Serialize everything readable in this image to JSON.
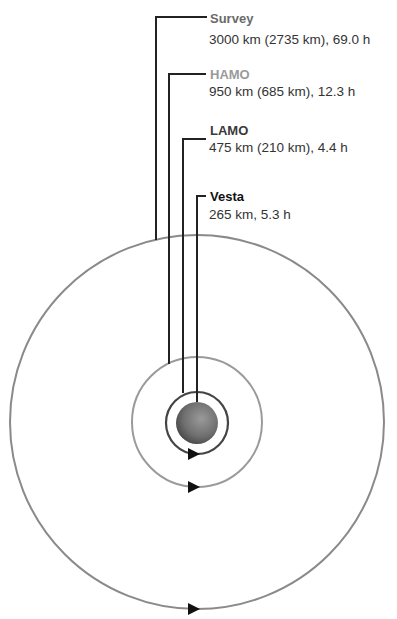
{
  "diagram": {
    "orbits": [
      {
        "name": "Survey",
        "detail": "3000 km (2735 km), 69.0 h",
        "label_color": "#6a6a6a",
        "ring_color": "#8a8a8a"
      },
      {
        "name": "HAMO",
        "detail": "950 km (685 km), 12.3 h",
        "label_color": "#9a9a9a",
        "ring_color": "#9a9a9a"
      },
      {
        "name": "LAMO",
        "detail": "475 km (210 km), 4.4 h",
        "label_color": "#3a3a3a",
        "ring_color": "#444444"
      },
      {
        "name": "Vesta",
        "detail": "265 km, 5.3 h",
        "label_color": "#111111",
        "ring_color": "#777777"
      }
    ],
    "leader_color": "#222222",
    "arrow_color": "#111111"
  }
}
